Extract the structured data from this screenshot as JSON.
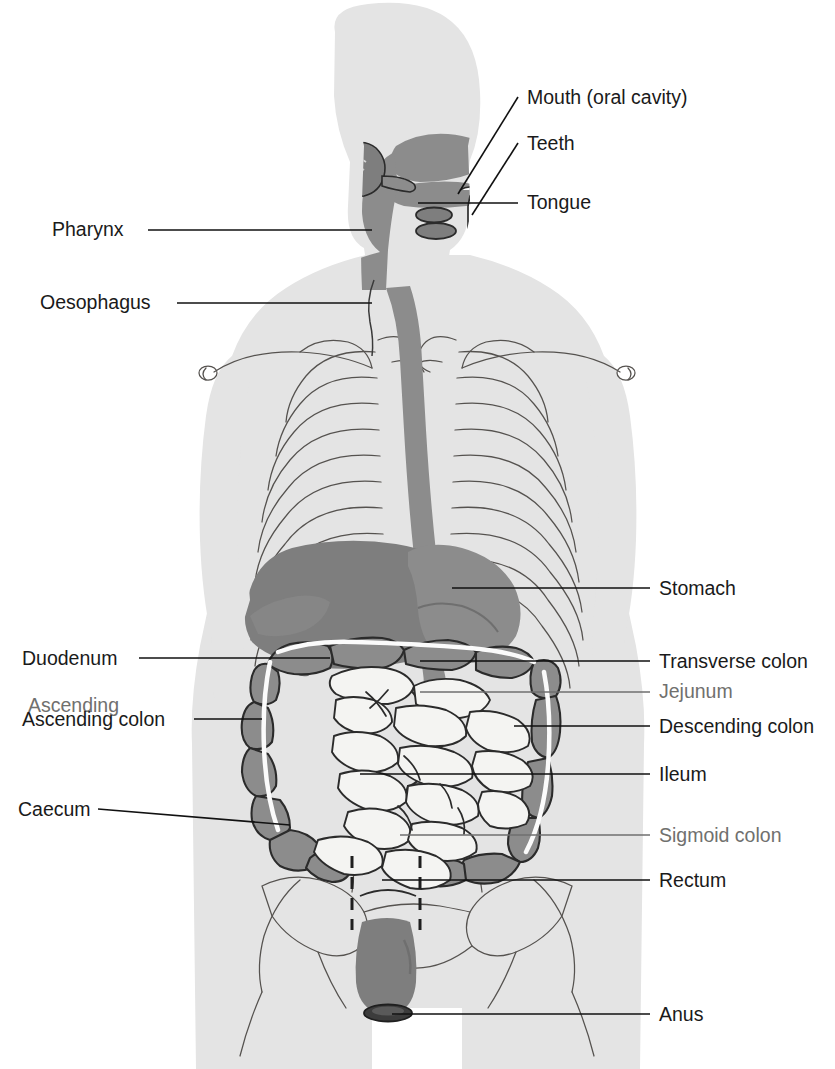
{
  "figure": {
    "view": "anterior whole-body silhouette"
  },
  "palette": {
    "background": "#ffffff",
    "body_silhouette": "#e4e4e4",
    "body_silhouette_light": "#ededed",
    "organ_dark": "#7e7e7e",
    "organ_mid": "#8c8c8c",
    "organ_light": "#f4f4f2",
    "outline": "#2b2b2b",
    "skeleton_line": "#55524f",
    "label_text": "#1a1a1a",
    "label_text_faint": "#70706e",
    "leader_line": "#111111"
  },
  "labels_left": [
    {
      "id": "pharynx",
      "text": "Pharynx",
      "text_x": 52,
      "text_y": 236,
      "line": "M148,230 L372,230"
    },
    {
      "id": "oesophagus",
      "text": "Oesophagus",
      "text_x": 40,
      "text_y": 309,
      "line": "M177,303 L372,303"
    },
    {
      "id": "duodenum",
      "text": "Duodenum",
      "text_x": 22,
      "text_y": 665,
      "line": "M139,658 L330,658"
    },
    {
      "id": "ascending-colon",
      "text": "Ascending colon",
      "text_x": 22,
      "text_y": 726,
      "line": "M194,719 L262,719"
    },
    {
      "id": "caecum",
      "text": "Caecum",
      "text_x": 18,
      "text_y": 816,
      "line": "M98,809 L290,825"
    }
  ],
  "labels_left_faint": [
    {
      "id": "ghost-ascending",
      "text": "Ascending",
      "text_x": 28,
      "text_y": 712
    }
  ],
  "labels_right": [
    {
      "id": "mouth",
      "text": "Mouth (oral cavity)",
      "text_x": 527,
      "text_y": 104,
      "line": "M458,194 L518,97"
    },
    {
      "id": "teeth",
      "text": "Teeth",
      "text_x": 527,
      "text_y": 150,
      "line": "M472,215 L518,143"
    },
    {
      "id": "tongue",
      "text": "Tongue",
      "text_x": 527,
      "text_y": 209,
      "line": "M418,203 L518,203"
    },
    {
      "id": "stomach",
      "text": "Stomach",
      "text_x": 659,
      "text_y": 595,
      "line": "M452,588 L650,588"
    },
    {
      "id": "transverse-colon",
      "text": "Transverse colon",
      "text_x": 659,
      "text_y": 668,
      "line": "M420,661 L650,661"
    },
    {
      "id": "descending-colon",
      "text": "Descending colon",
      "text_x": 659,
      "text_y": 733,
      "line": "M514,726 L650,726"
    },
    {
      "id": "ileum",
      "text": "Ileum",
      "text_x": 659,
      "text_y": 781,
      "line": "M360,774 L650,774"
    },
    {
      "id": "rectum",
      "text": "Rectum",
      "text_x": 659,
      "text_y": 887,
      "line": "M382,880 L650,880"
    },
    {
      "id": "anus",
      "text": "Anus",
      "text_x": 659,
      "text_y": 1021,
      "line": "M392,1014 L650,1014"
    }
  ],
  "labels_right_faint": [
    {
      "id": "jejunum",
      "text": "Jejunum",
      "text_x": 659,
      "text_y": 698,
      "line": "M420,692 L650,692"
    },
    {
      "id": "sigmoid-colon",
      "text": "Sigmoid colon",
      "text_x": 659,
      "text_y": 842,
      "line": "M400,835 L650,835"
    }
  ],
  "organs": [
    {
      "id": "mouth-oral-cavity",
      "name": "Mouth (oral cavity)"
    },
    {
      "id": "teeth",
      "name": "Teeth"
    },
    {
      "id": "tongue",
      "name": "Tongue"
    },
    {
      "id": "salivary-gland",
      "name": "Salivary gland"
    },
    {
      "id": "pharynx",
      "name": "Pharynx"
    },
    {
      "id": "oesophagus",
      "name": "Oesophagus"
    },
    {
      "id": "stomach",
      "name": "Stomach"
    },
    {
      "id": "liver",
      "name": "Liver"
    },
    {
      "id": "duodenum",
      "name": "Duodenum"
    },
    {
      "id": "jejunum",
      "name": "Jejunum"
    },
    {
      "id": "ileum",
      "name": "Ileum"
    },
    {
      "id": "caecum",
      "name": "Caecum"
    },
    {
      "id": "ascending-colon",
      "name": "Ascending colon"
    },
    {
      "id": "transverse-colon",
      "name": "Transverse colon"
    },
    {
      "id": "descending-colon",
      "name": "Descending colon"
    },
    {
      "id": "sigmoid-colon",
      "name": "Sigmoid colon"
    },
    {
      "id": "rectum",
      "name": "Rectum"
    },
    {
      "id": "anus",
      "name": "Anus"
    }
  ],
  "skeleton": {
    "rib_pairs": 10,
    "parts": [
      "clavicles",
      "ribcage",
      "sternum",
      "pelvis",
      "vertebral column"
    ]
  }
}
